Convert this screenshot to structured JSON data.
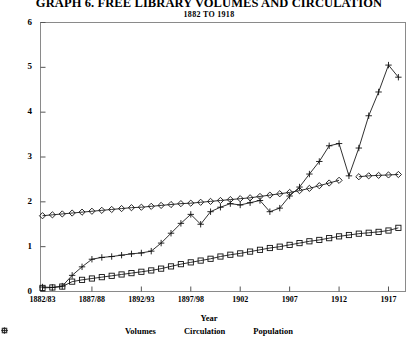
{
  "title": "GRAPH 6. FREE LIBRARY VOLUMES AND CIRCULATION",
  "subtitle": "1882 TO 1918",
  "axis_title_x": "Year",
  "legend": [
    {
      "marker": "square-marker",
      "label": "Volumes"
    },
    {
      "marker": "plus-marker",
      "label": "Circulation"
    },
    {
      "marker": "diamond-marker",
      "label": "Population"
    }
  ],
  "chart_data": {
    "type": "line",
    "title": "GRAPH 6. FREE LIBRARY VOLUMES AND CIRCULATION",
    "subtitle": "1882 TO 1918",
    "xlabel": "Year",
    "ylabel": "",
    "ylim": [
      0,
      6
    ],
    "yticks": [
      0,
      1,
      2,
      3,
      4,
      5,
      6
    ],
    "ytick_labels": [
      "0",
      "1",
      "2",
      "3",
      "4",
      "5",
      "6"
    ],
    "grid": false,
    "legend_position": "below",
    "x": [
      "1882/83",
      "1883/84",
      "1884/85",
      "1885/86",
      "1886/87",
      "1887/88",
      "1888/89",
      "1889/90",
      "1890/91",
      "1891/92",
      "1892/93",
      "1893/94",
      "1894/95",
      "1895/96",
      "1896/97",
      "1897/98",
      "1898/99",
      "1899/00",
      "1900/01",
      "1901",
      "1902",
      "1903",
      "1904",
      "1905",
      "1906",
      "1907",
      "1908",
      "1909",
      "1910",
      "1911",
      "1912",
      "1913",
      "1914",
      "1915",
      "1916",
      "1917",
      "1918"
    ],
    "xtick_labels": [
      "1882/83",
      "1887/88",
      "1892/93",
      "1897/98",
      "1902",
      "1907",
      "1912",
      "1917"
    ],
    "xtick_indices": [
      0,
      5,
      10,
      15,
      20,
      25,
      30,
      35
    ],
    "series": [
      {
        "name": "Volumes",
        "marker": "square",
        "values": [
          0.08,
          0.09,
          0.11,
          0.22,
          0.26,
          0.29,
          0.32,
          0.35,
          0.38,
          0.41,
          0.44,
          0.47,
          0.51,
          0.56,
          0.61,
          0.65,
          0.69,
          0.73,
          0.78,
          0.82,
          0.85,
          0.89,
          0.93,
          0.97,
          1.0,
          1.04,
          1.08,
          1.12,
          1.15,
          1.19,
          1.23,
          1.26,
          1.29,
          1.31,
          1.33,
          1.36,
          1.42
        ]
      },
      {
        "name": "Circulation",
        "marker": "plus",
        "values": [
          0.1,
          0.09,
          0.12,
          0.36,
          0.55,
          0.72,
          0.76,
          0.78,
          0.81,
          0.84,
          0.86,
          0.9,
          1.08,
          1.3,
          1.52,
          1.72,
          1.5,
          1.78,
          1.88,
          1.96,
          1.93,
          1.98,
          2.03,
          1.78,
          1.86,
          2.13,
          2.33,
          2.62,
          2.9,
          3.25,
          3.3,
          2.58,
          3.2,
          3.92,
          4.45,
          5.05,
          4.78
        ]
      },
      {
        "name": "Population",
        "marker": "diamond",
        "values": [
          1.69,
          1.71,
          1.73,
          1.75,
          1.77,
          1.79,
          1.81,
          1.83,
          1.85,
          1.87,
          1.88,
          1.9,
          1.92,
          1.94,
          1.96,
          1.97,
          1.99,
          2.01,
          2.03,
          2.05,
          2.07,
          2.09,
          2.12,
          2.15,
          2.18,
          2.21,
          2.25,
          2.3,
          2.36,
          2.42,
          2.48,
          null,
          2.56,
          2.58,
          2.59,
          2.6,
          2.61
        ]
      }
    ]
  }
}
